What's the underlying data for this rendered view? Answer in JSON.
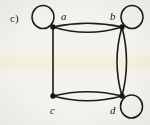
{
  "figure": {
    "panel_label": "c)",
    "caption_style": "multigraph",
    "background_color": "#f4f2ec",
    "ink_color": "#1a1a1f",
    "highlight_band_color": "#fcfad6",
    "width": 150,
    "height": 125
  },
  "vertices": [
    {
      "id": "a",
      "label": "a",
      "x": 53,
      "y": 27,
      "label_x": 61,
      "label_y": 12,
      "radius": 2.6
    },
    {
      "id": "b",
      "label": "b",
      "x": 122,
      "y": 27,
      "label_x": 110,
      "label_y": 12,
      "radius": 2.6
    },
    {
      "id": "c",
      "label": "c",
      "x": 53,
      "y": 96,
      "label_x": 50,
      "label_y": 106,
      "radius": 2.6
    },
    {
      "id": "d",
      "label": "d",
      "x": 122,
      "y": 96,
      "label_x": 110,
      "label_y": 106,
      "radius": 2.6
    }
  ],
  "loops": [
    {
      "id": "loop-a",
      "at": "a",
      "direction": "up-left",
      "cx": 43,
      "cy": 17,
      "rx": 11,
      "ry": 11
    },
    {
      "id": "loop-b",
      "at": "b",
      "direction": "up-right",
      "cx": 132,
      "cy": 17,
      "rx": 11,
      "ry": 11
    },
    {
      "id": "loop-d",
      "at": "d",
      "direction": "down-right",
      "cx": 131,
      "cy": 107,
      "rx": 11,
      "ry": 11
    }
  ],
  "edges": [
    {
      "id": "edge-ab-1",
      "from": "a",
      "to": "b",
      "multiplicity": 2,
      "index": 1,
      "curve": "up",
      "bow": 7
    },
    {
      "id": "edge-ab-2",
      "from": "a",
      "to": "b",
      "multiplicity": 2,
      "index": 2,
      "curve": "down",
      "bow": 7
    },
    {
      "id": "edge-ac-1",
      "from": "a",
      "to": "c",
      "multiplicity": 1,
      "index": 1,
      "curve": "straight",
      "bow": 0
    },
    {
      "id": "edge-bd-1",
      "from": "b",
      "to": "d",
      "multiplicity": 2,
      "index": 1,
      "curve": "left",
      "bow": 7
    },
    {
      "id": "edge-bd-2",
      "from": "b",
      "to": "d",
      "multiplicity": 2,
      "index": 2,
      "curve": "right",
      "bow": 7
    },
    {
      "id": "edge-cd-1",
      "from": "c",
      "to": "d",
      "multiplicity": 2,
      "index": 1,
      "curve": "up",
      "bow": 7
    },
    {
      "id": "edge-cd-2",
      "from": "c",
      "to": "d",
      "multiplicity": 2,
      "index": 2,
      "curve": "down",
      "bow": 7
    }
  ],
  "degrees": {
    "a": 5,
    "b": 7,
    "c": 3,
    "d": 7
  }
}
